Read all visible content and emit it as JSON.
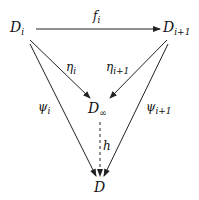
{
  "diagram": {
    "type": "commutative-diagram",
    "nodes": {
      "D_i": {
        "base": "D",
        "sub": "i"
      },
      "D_i1": {
        "base": "D",
        "sub": "i+1"
      },
      "D_inf": {
        "base": "D",
        "sub": "∞"
      },
      "D": {
        "base": "D",
        "sub": ""
      }
    },
    "edges": {
      "f_i": {
        "base": "f",
        "sub": "i",
        "from": "D_i",
        "to": "D_i1",
        "style": "solid"
      },
      "eta_i": {
        "base": "η",
        "sub": "i",
        "from": "D_i",
        "to": "D_inf",
        "style": "solid"
      },
      "eta_i1": {
        "base": "η",
        "sub": "i+1",
        "from": "D_i1",
        "to": "D_inf",
        "style": "solid"
      },
      "psi_i": {
        "base": "ψ",
        "sub": "i",
        "from": "D_i",
        "to": "D",
        "style": "solid"
      },
      "psi_i1": {
        "base": "ψ",
        "sub": "i+1",
        "from": "D_i1",
        "to": "D",
        "style": "solid"
      },
      "h": {
        "base": "h",
        "sub": "",
        "from": "D_inf",
        "to": "D",
        "style": "dashed"
      }
    },
    "colors": {
      "stroke": "#222222",
      "text": "#111111"
    }
  }
}
